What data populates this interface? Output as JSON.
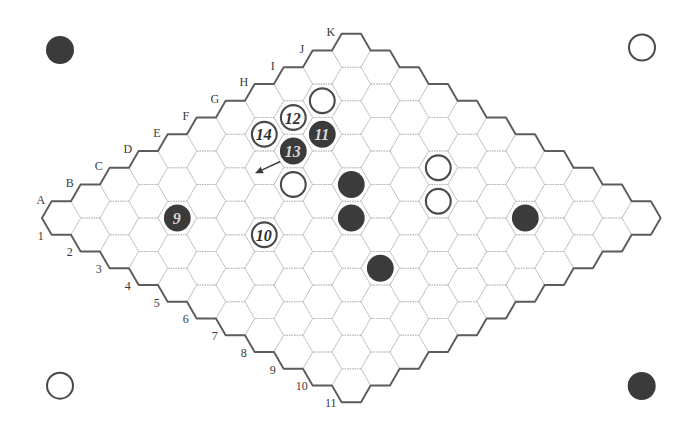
{
  "figure": {
    "type": "hex-board",
    "size": 11,
    "column_labels": [
      "A",
      "B",
      "C",
      "D",
      "E",
      "F",
      "G",
      "H",
      "I",
      "J",
      "K"
    ],
    "row_labels": [
      "1",
      "2",
      "3",
      "4",
      "5",
      "6",
      "7",
      "8",
      "9",
      "10",
      "11"
    ],
    "stones": [
      {
        "cell": "C3",
        "color": "black",
        "label": "9"
      },
      {
        "cell": "D5",
        "color": "white",
        "label": "10"
      },
      {
        "cell": "H3",
        "color": "black",
        "label": "11"
      },
      {
        "cell": "H2",
        "color": "white",
        "label": "12"
      },
      {
        "cell": "G3",
        "color": "black",
        "label": "13"
      },
      {
        "cell": "G2",
        "color": "white",
        "label": "14"
      },
      {
        "cell": "I2",
        "color": "white",
        "label": ""
      },
      {
        "cell": "F4",
        "color": "white",
        "label": ""
      },
      {
        "cell": "G5",
        "color": "black",
        "label": ""
      },
      {
        "cell": "F6",
        "color": "black",
        "label": ""
      },
      {
        "cell": "E8",
        "color": "black",
        "label": ""
      },
      {
        "cell": "I6",
        "color": "white",
        "label": ""
      },
      {
        "cell": "H7",
        "color": "white",
        "label": ""
      },
      {
        "cell": "I9",
        "color": "black",
        "label": ""
      }
    ],
    "corner_markers": [
      {
        "corner": "top-left",
        "color": "black"
      },
      {
        "corner": "top-right",
        "color": "white"
      },
      {
        "corner": "bottom-left",
        "color": "white"
      },
      {
        "corner": "bottom-right",
        "color": "black"
      }
    ],
    "arrow": {
      "from_cell": "G3",
      "direction": "down-left"
    }
  },
  "colors": {
    "black_stone": "#3b3b3b",
    "white_stone_fill": "#ffffff",
    "white_stone_ring": "#4a4a4a",
    "black_stone_text": "#d8d8d8",
    "white_stone_text": "#2e2e2e",
    "board_border": "#5c5c5c",
    "grid_line": "#b4b4b4",
    "arrow": "#3a3a3a"
  }
}
